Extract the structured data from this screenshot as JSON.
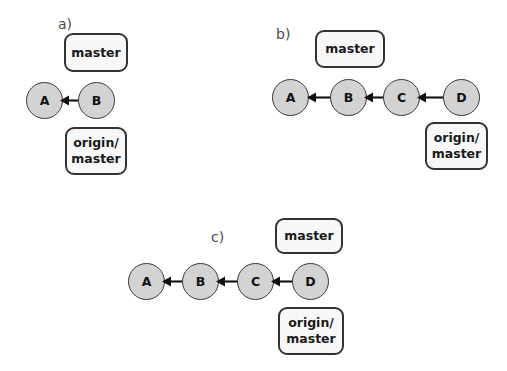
{
  "figure": {
    "type": "diagram",
    "background_color": "#ffffff",
    "commit_fill_color": "#d3d3d3",
    "commit_stroke_color": "#3a3a3a",
    "box_fill_color": "#f8f8f8",
    "box_stroke_color": "#333333",
    "arrow_color": "#111111"
  },
  "panels": [
    {
      "id": "a",
      "label": "a)",
      "commits": [
        {
          "id": "a-commit-a",
          "label": "A"
        },
        {
          "id": "a-commit-b",
          "label": "B"
        }
      ],
      "edges": [
        {
          "from": "B",
          "to": "A",
          "direction": "left"
        }
      ],
      "refs": [
        {
          "id": "a-ref-master",
          "label": "master",
          "points_to": "B",
          "position": "above"
        },
        {
          "id": "a-ref-origin-master",
          "label": "origin/\nmaster",
          "points_to": "B",
          "position": "below"
        }
      ]
    },
    {
      "id": "b",
      "label": "b)",
      "commits": [
        {
          "id": "b-commit-a",
          "label": "A"
        },
        {
          "id": "b-commit-b",
          "label": "B"
        },
        {
          "id": "b-commit-c",
          "label": "C"
        },
        {
          "id": "b-commit-d",
          "label": "D"
        }
      ],
      "edges": [
        {
          "from": "B",
          "to": "A",
          "direction": "left"
        },
        {
          "from": "C",
          "to": "B",
          "direction": "left"
        },
        {
          "from": "D",
          "to": "C",
          "direction": "left"
        }
      ],
      "refs": [
        {
          "id": "b-ref-master",
          "label": "master",
          "points_to": "B",
          "position": "above"
        },
        {
          "id": "b-ref-origin-master",
          "label": "origin/\nmaster",
          "points_to": "D",
          "position": "below"
        }
      ]
    },
    {
      "id": "c",
      "label": "c)",
      "commits": [
        {
          "id": "c-commit-a",
          "label": "A"
        },
        {
          "id": "c-commit-b",
          "label": "B"
        },
        {
          "id": "c-commit-c",
          "label": "C"
        },
        {
          "id": "c-commit-d",
          "label": "D"
        }
      ],
      "edges": [
        {
          "from": "B",
          "to": "A",
          "direction": "left"
        },
        {
          "from": "C",
          "to": "B",
          "direction": "left"
        },
        {
          "from": "D",
          "to": "C",
          "direction": "left"
        }
      ],
      "refs": [
        {
          "id": "c-ref-master",
          "label": "master",
          "points_to": "D",
          "position": "above"
        },
        {
          "id": "c-ref-origin-master",
          "label": "origin/\nmaster",
          "points_to": "D",
          "position": "below"
        }
      ]
    }
  ]
}
